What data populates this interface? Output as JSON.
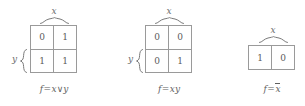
{
  "figure": {
    "background": "#ffffff",
    "line_color": "#9a9a9a",
    "text_color": "#5f5f5f"
  },
  "maps": [
    {
      "id": "or-map",
      "top_label": "x",
      "left_label": "y",
      "rows": [
        [
          "0",
          "1"
        ],
        [
          "1",
          "1"
        ]
      ],
      "caption": {
        "fn": "f",
        "eq": "=",
        "lhs": "x",
        "op": "∨",
        "rhs": "y"
      }
    },
    {
      "id": "and-map",
      "top_label": "x",
      "left_label": "y",
      "rows": [
        [
          "0",
          "0"
        ],
        [
          "0",
          "1"
        ]
      ],
      "caption": {
        "fn": "f",
        "eq": "=",
        "lhs": "x",
        "op": "",
        "rhs": "y"
      }
    },
    {
      "id": "not-map",
      "top_label": "x",
      "left_label": "",
      "rows": [
        [
          "1",
          "0"
        ]
      ],
      "caption": {
        "fn": "f",
        "eq": "=",
        "lhs": "",
        "op": "",
        "rhs": "x",
        "overline": true
      }
    }
  ]
}
